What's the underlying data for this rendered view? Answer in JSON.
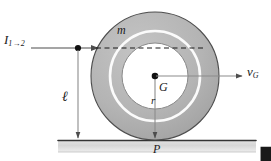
{
  "figure": {
    "background": "#ffffff",
    "width": 271,
    "height": 161
  },
  "colors": {
    "wheel_body": "#b3b3b3",
    "wheel_outline": "#4d4d4d",
    "hub_fill": "#ffffff",
    "gyration_ring": "#ffffff",
    "ground_fill": "#d9d9d9",
    "ground_line": "#333333",
    "line_color": "#666666",
    "dashed_color": "#1a1a1a",
    "text_color": "#1a1a1a"
  },
  "labels": {
    "impulse": {
      "symbol": "I",
      "subscript": "1→2",
      "name": "impulse-label"
    },
    "distance": {
      "symbol": "ℓ",
      "name": "height-label"
    },
    "mass": {
      "symbol": "m",
      "name": "mass-label"
    },
    "center": {
      "symbol": "G",
      "name": "center-of-mass-label"
    },
    "radius": {
      "symbol": "r",
      "name": "radius-label"
    },
    "contact": {
      "symbol": "P",
      "name": "contact-point-label"
    },
    "velocity": {
      "symbol": "v",
      "subscript": "G",
      "name": "velocity-vector-label"
    }
  },
  "geometry": {
    "center": {
      "x": 155,
      "y": 76
    },
    "outer_radius": 68,
    "gyration_radius": 45,
    "hub_radius": 33,
    "ground_y": 140,
    "ground_left": 58,
    "ground_right": 256,
    "impulse_line_y": 48,
    "impulse_point": {
      "x": 78,
      "y": 48
    },
    "velocity_arrow_tip": {
      "x": 243,
      "y": 76
    }
  }
}
